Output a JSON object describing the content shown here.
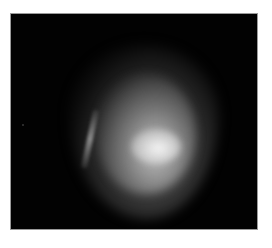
{
  "image": {
    "description": "Grayscale photograph of a diffuse bright glowing blob on black background",
    "background_color": "#020202",
    "page_color": "#ffffff",
    "border_color": "#9a9a9a",
    "highlight_color": "#f5f5f5"
  }
}
